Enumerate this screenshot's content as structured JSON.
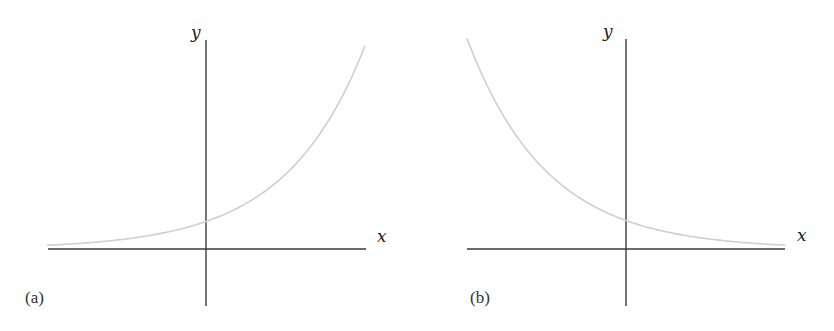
{
  "figure": {
    "panels": [
      {
        "id": "a",
        "label": "(a)",
        "x_axis_label": "x",
        "y_axis_label": "y",
        "description": "Exponential growth curve y = e^x"
      },
      {
        "id": "b",
        "label": "(b)",
        "x_axis_label": "x",
        "y_axis_label": "y",
        "description": "Exponential decay curve y = e^-x"
      }
    ],
    "colors": {
      "axis": "#3a3a3a",
      "curve": "#cfcfcf",
      "background": "#ffffff"
    }
  },
  "chart_data": [
    {
      "type": "line",
      "title": "(a)",
      "xlabel": "x",
      "ylabel": "y",
      "x": [
        -2,
        -1.5,
        -1,
        -0.5,
        0,
        0.5,
        1,
        1.5,
        2
      ],
      "series": [
        {
          "name": "y = e^x",
          "values": [
            0.14,
            0.22,
            0.37,
            0.61,
            1.0,
            1.65,
            2.72,
            4.48,
            7.39
          ]
        }
      ],
      "xlim": [
        -2,
        2
      ],
      "ylim": [
        -1.5,
        7.5
      ],
      "grid": false,
      "legend": "none"
    },
    {
      "type": "line",
      "title": "(b)",
      "xlabel": "x",
      "ylabel": "y",
      "x": [
        -2,
        -1.5,
        -1,
        -0.5,
        0,
        0.5,
        1,
        1.5,
        2
      ],
      "series": [
        {
          "name": "y = e^-x",
          "values": [
            7.39,
            4.48,
            2.72,
            1.65,
            1.0,
            0.61,
            0.37,
            0.22,
            0.14
          ]
        }
      ],
      "xlim": [
        -2,
        2
      ],
      "ylim": [
        -1.5,
        7.5
      ],
      "grid": false,
      "legend": "none"
    }
  ]
}
